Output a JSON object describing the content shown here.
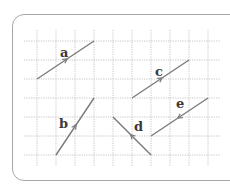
{
  "diagram": {
    "title": "",
    "grid": {
      "x_lines": [
        37,
        56,
        75,
        94,
        113,
        132,
        151,
        170,
        189,
        208
      ],
      "y_lines": [
        41,
        60,
        79,
        98,
        117,
        136,
        155
      ],
      "x_extent": [
        24,
        220
      ],
      "y_extent": [
        30,
        166
      ],
      "color": "#b8b8b8"
    },
    "line_color": "#7a7a7a",
    "vectors": [
      {
        "label": "a",
        "from": [
          37,
          79
        ],
        "to": [
          94,
          41
        ],
        "label_pos": [
          60,
          57
        ]
      },
      {
        "label": "b",
        "from": [
          56,
          155
        ],
        "to": [
          94,
          98
        ],
        "label_pos": [
          59,
          128
        ]
      },
      {
        "label": "c",
        "from": [
          132,
          98
        ],
        "to": [
          189,
          60
        ],
        "label_pos": [
          155,
          76
        ]
      },
      {
        "label": "d",
        "from": [
          151,
          155
        ],
        "to": [
          113,
          117
        ],
        "label_pos": [
          134,
          131
        ]
      },
      {
        "label": "e",
        "from": [
          208,
          98
        ],
        "to": [
          151,
          136
        ],
        "label_pos": [
          176,
          108
        ]
      }
    ]
  }
}
